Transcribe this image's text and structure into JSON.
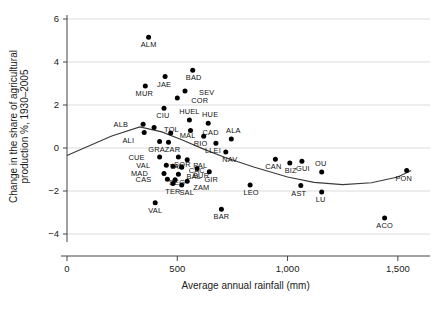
{
  "chart_data": {
    "type": "scatter",
    "title": "",
    "xlabel": "Average annual rainfall (mm)",
    "ylabel": "Change in the share of agricultural production %, 1930–2005",
    "xlim": [
      0,
      1620
    ],
    "ylim": [
      -4.6,
      6.4
    ],
    "xticks": [
      0,
      500,
      1000,
      1500
    ],
    "xticklabels": [
      "0",
      "500",
      "1,000",
      "1,500"
    ],
    "yticks": [
      -4,
      -2,
      0,
      2,
      4,
      6
    ],
    "yticklabels": [
      "−4",
      "−2",
      "0",
      "2",
      "4",
      "6"
    ],
    "grid": "horizontal",
    "legend": "none",
    "point_color": "#000000",
    "trend_color": "#3a3a3a",
    "grid_color": "#dcdcdc",
    "has_trend_line": true,
    "trend_note": "fitted curve, U-shaped, declining then flattening",
    "trend_points": [
      {
        "x": 0,
        "y": -0.35
      },
      {
        "x": 200,
        "y": 0.55
      },
      {
        "x": 330,
        "y": 0.98
      },
      {
        "x": 430,
        "y": 0.75
      },
      {
        "x": 520,
        "y": 0.38
      },
      {
        "x": 620,
        "y": -0.05
      },
      {
        "x": 720,
        "y": -0.45
      },
      {
        "x": 850,
        "y": -0.9
      },
      {
        "x": 1000,
        "y": -1.35
      },
      {
        "x": 1120,
        "y": -1.6
      },
      {
        "x": 1250,
        "y": -1.7
      },
      {
        "x": 1380,
        "y": -1.62
      },
      {
        "x": 1500,
        "y": -1.35
      },
      {
        "x": 1560,
        "y": -1.05
      }
    ],
    "points": [
      {
        "label": "ALM",
        "x": 370,
        "y": 5.15,
        "lx": 0,
        "ly": 10
      },
      {
        "label": "BAD",
        "x": 570,
        "y": 3.62,
        "lx": 1,
        "ly": 10
      },
      {
        "label": "JAE",
        "x": 445,
        "y": 3.32,
        "lx": -1,
        "ly": 10
      },
      {
        "label": "MUR",
        "x": 355,
        "y": 2.88,
        "lx": -1,
        "ly": 10
      },
      {
        "label": "SEV",
        "x": 535,
        "y": 2.65,
        "lx": 14,
        "ly": 4
      },
      {
        "label": "COR",
        "x": 500,
        "y": 2.33,
        "lx": 14,
        "ly": 5
      },
      {
        "label": "CIU",
        "x": 440,
        "y": 1.85,
        "lx": -1,
        "ly": 10
      },
      {
        "label": "HUEL",
        "x": 555,
        "y": 1.3,
        "lx": 0,
        "ly": -6
      },
      {
        "label": "HUE",
        "x": 640,
        "y": 1.15,
        "lx": 2,
        "ly": -6
      },
      {
        "label": "ALB",
        "x": 345,
        "y": 1.1,
        "lx": -15,
        "ly": 3
      },
      {
        "label": "TOL",
        "x": 395,
        "y": 0.95,
        "lx": 10,
        "ly": 4
      },
      {
        "label": "CAD",
        "x": 560,
        "y": 0.82,
        "lx": 12,
        "ly": 5
      },
      {
        "label": "ALI",
        "x": 350,
        "y": 0.72,
        "lx": -10,
        "ly": 10
      },
      {
        "label": "MAL",
        "x": 470,
        "y": 0.7,
        "lx": 9,
        "ly": 5
      },
      {
        "label": "RIO",
        "x": 620,
        "y": 0.55,
        "lx": -3,
        "ly": 10
      },
      {
        "label": "ALA",
        "x": 745,
        "y": 0.42,
        "lx": 2,
        "ly": -6
      },
      {
        "label": "GRA",
        "x": 420,
        "y": 0.3,
        "lx": -3,
        "ly": 10
      },
      {
        "label": "ZAR",
        "x": 460,
        "y": 0.27,
        "lx": 4,
        "ly": 10
      },
      {
        "label": "LLEI",
        "x": 675,
        "y": 0.22,
        "lx": -3,
        "ly": 10
      },
      {
        "label": "NAV",
        "x": 720,
        "y": -0.18,
        "lx": 4,
        "ly": 10
      },
      {
        "label": "CUE",
        "x": 420,
        "y": -0.42,
        "lx": -15,
        "ly": 3
      },
      {
        "label": "SOR",
        "x": 505,
        "y": -0.42,
        "lx": 4,
        "ly": 10
      },
      {
        "label": "PAL",
        "x": 545,
        "y": -0.55,
        "lx": 6,
        "ly": 8
      },
      {
        "label": "CAN",
        "x": 945,
        "y": -0.52,
        "lx": -2,
        "ly": 10
      },
      {
        "label": "BIZ",
        "x": 1010,
        "y": -0.7,
        "lx": 1,
        "ly": 10
      },
      {
        "label": "GUI",
        "x": 1065,
        "y": -0.62,
        "lx": 1,
        "ly": 10
      },
      {
        "label": "VAL",
        "x": 450,
        "y": -0.8,
        "lx": -16,
        "ly": 3
      },
      {
        "label": "TAR",
        "x": 480,
        "y": -0.85,
        "lx": 4,
        "ly": 3
      },
      {
        "label": "CAC",
        "x": 520,
        "y": -0.9,
        "lx": 7,
        "ly": 6
      },
      {
        "label": "BUR",
        "x": 590,
        "y": -0.95,
        "lx": 4,
        "ly": 10
      },
      {
        "label": "GIR",
        "x": 645,
        "y": -1.1,
        "lx": 2,
        "ly": 10
      },
      {
        "label": "OU",
        "x": 1155,
        "y": -1.12,
        "lx": -1,
        "ly": -6
      },
      {
        "label": "MAD",
        "x": 440,
        "y": -1.18,
        "lx": -16,
        "ly": 3
      },
      {
        "label": "BAL",
        "x": 505,
        "y": -1.22,
        "lx": 8,
        "ly": 5
      },
      {
        "label": "PON",
        "x": 1540,
        "y": -1.05,
        "lx": -3,
        "ly": 10
      },
      {
        "label": "CAS",
        "x": 455,
        "y": -1.45,
        "lx": -16,
        "ly": 3
      },
      {
        "label": "SEG",
        "x": 490,
        "y": -1.48,
        "lx": 2,
        "ly": 5
      },
      {
        "label": "ZAM",
        "x": 545,
        "y": -1.55,
        "lx": 6,
        "ly": 9
      },
      {
        "label": "TER",
        "x": 480,
        "y": -1.65,
        "lx": 0,
        "ly": 10
      },
      {
        "label": "SAL",
        "x": 520,
        "y": -1.72,
        "lx": 5,
        "ly": 10
      },
      {
        "label": "LEO",
        "x": 830,
        "y": -1.72,
        "lx": 1,
        "ly": 10
      },
      {
        "label": "AST",
        "x": 1060,
        "y": -1.75,
        "lx": -2,
        "ly": 10
      },
      {
        "label": "LU",
        "x": 1155,
        "y": -2.05,
        "lx": -1,
        "ly": 10
      },
      {
        "label": "VAL2",
        "x": 400,
        "y": -2.55,
        "lx": 0,
        "ly": 10,
        "text": "VAL"
      },
      {
        "label": "BAR",
        "x": 700,
        "y": -2.85,
        "lx": 0,
        "ly": 10
      },
      {
        "label": "ACO",
        "x": 1440,
        "y": -3.25,
        "lx": 0,
        "ly": 10
      }
    ]
  }
}
